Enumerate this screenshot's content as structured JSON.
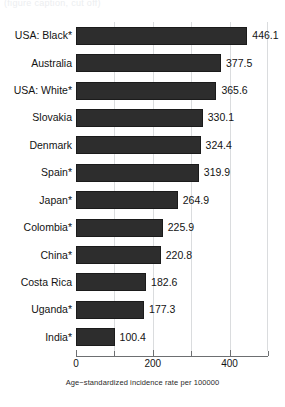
{
  "top_fragment": "(figure caption, cut off)",
  "chart_data": {
    "type": "bar",
    "orientation": "horizontal",
    "title": "",
    "subtitle": "",
    "xlabel": "Age−standardized incidence rate per 100000",
    "ylabel": "",
    "categories": [
      "USA: Black*",
      "Australia",
      "USA: White*",
      "Slovakia",
      "Denmark",
      "Spain*",
      "Japan*",
      "Colombia*",
      "China*",
      "Costa Rica",
      "Uganda*",
      "India*"
    ],
    "values": [
      446.1,
      377.5,
      365.6,
      330.1,
      324.4,
      319.9,
      264.9,
      225.9,
      220.8,
      182.6,
      177.3,
      100.4
    ],
    "value_labels": [
      "446.1",
      "377.5",
      "365.6",
      "330.1",
      "324.4",
      "319.9",
      "264.9",
      "225.9",
      "220.8",
      "182.6",
      "177.3",
      "100.4"
    ],
    "xlim": [
      0,
      500
    ],
    "xticks": [
      0,
      100,
      200,
      300,
      400,
      500
    ],
    "xtick_labels": [
      "0",
      "",
      "200",
      "",
      "400",
      ""
    ],
    "gridlines": [
      100,
      200,
      300,
      400,
      500
    ],
    "grid": true,
    "legend": null,
    "bar_color": "#2d2d2d",
    "grid_color": "#dadcde",
    "axis_color": "#6d6f71",
    "text_color": "#131313"
  }
}
